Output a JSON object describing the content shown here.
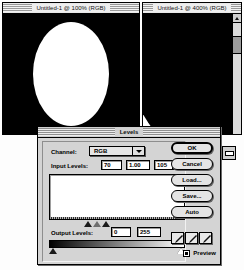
{
  "app": {
    "name": "Adobe Photoshop",
    "platform": "Mac OS classic"
  },
  "windows": [
    {
      "id": "document-100",
      "title": "Untitled-1 @ 100% (RGB)",
      "zoom": "100%",
      "mode": "RGB",
      "content": "white ellipse on black background"
    },
    {
      "id": "document-400",
      "title": "Untitled-1 @ 400% (RGB)",
      "zoom": "400%",
      "mode": "RGB",
      "content": "magnified ellipse edge, black arc on white"
    }
  ],
  "dialog": {
    "title": "Levels",
    "channel": {
      "label": "Channel:",
      "selected": "RGB",
      "options": [
        "RGB",
        "Red",
        "Green",
        "Blue"
      ]
    },
    "input_levels": {
      "label": "Input Levels:",
      "shadow": "70",
      "midtone": "1.00",
      "highlight": "105"
    },
    "output_levels": {
      "label": "Output Levels:",
      "black": "0",
      "white": "255"
    },
    "buttons": [
      {
        "name": "ok",
        "label": "OK",
        "default": true
      },
      {
        "name": "cancel",
        "label": "Cancel",
        "default": false
      },
      {
        "name": "load",
        "label": "Load...",
        "default": false
      },
      {
        "name": "save",
        "label": "Save...",
        "default": false
      },
      {
        "name": "auto",
        "label": "Auto",
        "default": false
      }
    ],
    "eyedroppers": [
      {
        "name": "black-point-eyedropper",
        "icon": "eyedropper-icon"
      },
      {
        "name": "gray-point-eyedropper",
        "icon": "eyedropper-icon"
      },
      {
        "name": "white-point-eyedropper",
        "icon": "eyedropper-icon"
      }
    ],
    "preview": {
      "label": "Preview",
      "checked": true
    }
  },
  "chart_data": {
    "type": "bar",
    "xlabel": "Input level",
    "ylabel": "Pixel count",
    "xlim": [
      0,
      255
    ],
    "grid": false,
    "note": "Bimodal flat histogram: near-zero counts across the range with a large spike at the white end",
    "categories": [
      "0",
      "32",
      "64",
      "96",
      "128",
      "160",
      "192",
      "224",
      "255"
    ],
    "values": [
      2,
      1,
      1,
      1,
      1,
      1,
      1,
      3,
      44
    ]
  }
}
